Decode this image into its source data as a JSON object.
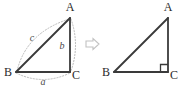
{
  "figure": {
    "colors": {
      "edge": "#3a3a3a",
      "arc": "#b9b9b9",
      "vertex_text": "#2b2b2b",
      "side_text": "#4a4a4a",
      "arrow": "#c2c2c2",
      "background": "#ffffff"
    },
    "left_triangle": {
      "name": "labeled-triangle",
      "vertices": [
        {
          "id": "A",
          "label": "A",
          "x": 70,
          "y": 18,
          "label_x": 70,
          "label_y": 11
        },
        {
          "id": "B",
          "label": "B",
          "x": 16,
          "y": 72,
          "label_x": 8,
          "label_y": 76
        },
        {
          "id": "C",
          "label": "C",
          "x": 70,
          "y": 72,
          "label_x": 74,
          "label_y": 80
        }
      ],
      "sides": [
        {
          "id": "c",
          "label": "c",
          "from": "B",
          "to": "A",
          "label_x": 32,
          "label_y": 40
        },
        {
          "id": "b",
          "label": "b",
          "from": "A",
          "to": "C",
          "label_x": 62,
          "label_y": 48
        },
        {
          "id": "a",
          "label": "a",
          "from": "B",
          "to": "C",
          "label_x": 43,
          "label_y": 85
        }
      ],
      "arcs_style": "dotted"
    },
    "arrow": {
      "name": "transforms-to-arrow",
      "glyph": "right-arrow-outline",
      "x": 92,
      "y": 44
    },
    "right_triangle": {
      "name": "right-angle-triangle",
      "vertices": [
        {
          "id": "A",
          "label": "A",
          "x": 168,
          "y": 18,
          "label_x": 168,
          "label_y": 11
        },
        {
          "id": "B",
          "label": "B",
          "x": 114,
          "y": 72,
          "label_x": 106,
          "label_y": 76
        },
        {
          "id": "C",
          "label": "C",
          "x": 168,
          "y": 72,
          "label_x": 172,
          "label_y": 80
        }
      ],
      "right_angle": {
        "at": "C",
        "size": 7
      }
    }
  }
}
